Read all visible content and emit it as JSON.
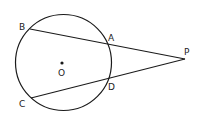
{
  "diagram": {
    "type": "geometry",
    "colors": {
      "stroke": "#1a1a1a",
      "background": "#ffffff",
      "label": "#222222"
    },
    "circle": {
      "center_label": "O",
      "cx": 63.5,
      "cy": 62.5,
      "r": 48
    },
    "points": {
      "B": {
        "label": "B",
        "x": 30,
        "y": 29
      },
      "A": {
        "label": "A",
        "x": 107,
        "y": 43
      },
      "P": {
        "label": "P",
        "x": 185,
        "y": 59
      },
      "D": {
        "label": "D",
        "x": 107,
        "y": 80
      },
      "C": {
        "label": "C",
        "x": 31,
        "y": 98
      },
      "O": {
        "label": "O",
        "x": 62,
        "y": 63
      }
    },
    "segments": [
      {
        "name": "secant-PB",
        "from": "P",
        "to": "B"
      },
      {
        "name": "secant-PC",
        "from": "P",
        "to": "C"
      }
    ]
  }
}
